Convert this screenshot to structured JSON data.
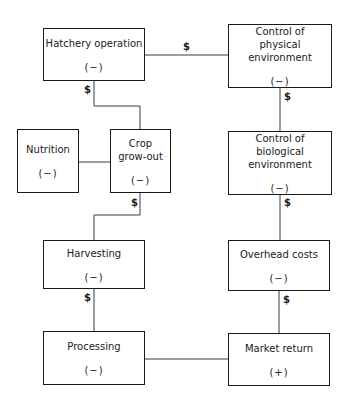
{
  "nodes": {
    "hatchery": {
      "label": "Hatchery operation",
      "sign": "(−)"
    },
    "physical": {
      "label": "Control of physical environment",
      "sign": "(−)"
    },
    "nutrition": {
      "label": "Nutrition",
      "sign": "(−)"
    },
    "crop": {
      "label": "Crop grow-out",
      "sign": "(−)"
    },
    "biological": {
      "label": "Control of biological environment",
      "sign": "(−)"
    },
    "harvesting": {
      "label": "Harvesting",
      "sign": "(−)"
    },
    "overhead": {
      "label": "Overhead costs",
      "sign": "(−)"
    },
    "processing": {
      "label": "Processing",
      "sign": "(−)"
    },
    "market": {
      "label": "Market return",
      "sign": "(+)"
    }
  },
  "cost_symbol": "$",
  "edges": [
    {
      "from": "hatchery",
      "to": "physical",
      "label": "$"
    },
    {
      "from": "hatchery",
      "to": "crop",
      "label": "$"
    },
    {
      "from": "nutrition",
      "to": "crop",
      "label": ""
    },
    {
      "from": "crop",
      "to": "harvesting",
      "label": "$"
    },
    {
      "from": "harvesting",
      "to": "processing",
      "label": "$"
    },
    {
      "from": "processing",
      "to": "market",
      "label": ""
    },
    {
      "from": "physical",
      "to": "biological",
      "label": "$"
    },
    {
      "from": "biological",
      "to": "overhead",
      "label": "$"
    },
    {
      "from": "overhead",
      "to": "market",
      "label": "$"
    }
  ]
}
